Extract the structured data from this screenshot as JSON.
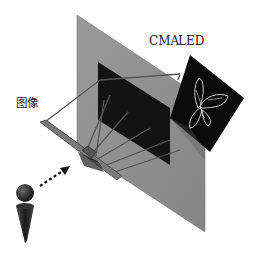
{
  "diagram": {
    "title": "",
    "labels": {
      "cma": "CMA",
      "led": "LED",
      "image": "图像"
    },
    "components": [
      {
        "id": "cma-plate",
        "description": "Large gray semi-transparent CMA plate, tilted diagonally"
      },
      {
        "id": "black-region",
        "description": "Dark rectangular region on the CMA plate"
      },
      {
        "id": "led-display",
        "description": "Black LED panel showing a white outline butterfly"
      },
      {
        "id": "floating-image",
        "description": "Floating aerial image frame (图像) in front of plate"
      },
      {
        "id": "viewer",
        "description": "Observer figure (head + cone body)"
      },
      {
        "id": "view-arrow",
        "description": "Dotted arrow from viewer toward the floating image"
      },
      {
        "id": "light-rays",
        "description": "Gray ray lines from the LED through the plate converging at the floating image"
      }
    ],
    "colors": {
      "plate": "#8a8a8a",
      "plate_edge": "#7a7a7a",
      "black_region": "#141414",
      "led_panel": "#0a0a0a",
      "butterfly": "#e6e6e6",
      "rays": "#5a5a5a",
      "viewer": "#2a2a2a",
      "text": "#222222"
    },
    "caption": ""
  }
}
